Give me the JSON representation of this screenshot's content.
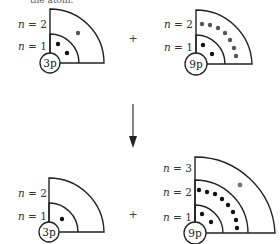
{
  "top_caption_partial": "tile atom.",
  "operator_plus": "+",
  "colors": {
    "stroke": "#222222",
    "inner_electron": "#111111",
    "outer_electron": "#555555"
  },
  "panels": [
    {
      "id": "top-left",
      "core": "3p",
      "shell_labels": [
        "n = 1",
        "n = 2"
      ],
      "shells": 2,
      "electrons_n1": 2,
      "electrons_n2": 1,
      "electrons_n3": 0
    },
    {
      "id": "top-right",
      "core": "9p",
      "shell_labels": [
        "n = 1",
        "n = 2"
      ],
      "shells": 2,
      "electrons_n1": 2,
      "electrons_n2": 7,
      "electrons_n3": 0
    },
    {
      "id": "bottom-left",
      "core": "3p",
      "shell_labels": [
        "n = 1",
        "n = 2"
      ],
      "shells": 2,
      "electrons_n1": 1,
      "electrons_n2": 0,
      "electrons_n3": 0
    },
    {
      "id": "bottom-right",
      "core": "9p",
      "shell_labels": [
        "n = 1",
        "n = 2",
        "n = 3"
      ],
      "shells": 3,
      "electrons_n1": 2,
      "electrons_n2": 8,
      "electrons_n3": 1
    }
  ],
  "arrow": {
    "direction": "down"
  }
}
